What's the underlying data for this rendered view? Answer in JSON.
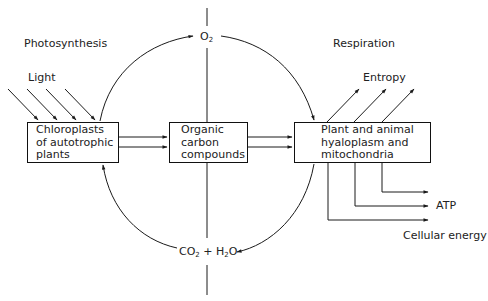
{
  "labels": {
    "photosynthesis": "Photosynthesis",
    "respiration": "Respiration",
    "light": "Light",
    "entropy": "Entropy",
    "atp": "ATP",
    "cellular_energy": "Cellular energy",
    "o2": {
      "base": "O",
      "sub": "2"
    },
    "co2_h2o": {
      "co": "CO",
      "co_sub": "2",
      "plus": " + ",
      "h": "H",
      "h_sub": "2",
      "o": "O"
    }
  },
  "boxes": {
    "chloroplasts": {
      "line1": "Chloroplasts",
      "line2": "of autotrophic",
      "line3": "plants"
    },
    "organic": {
      "line1": "Organic",
      "line2": "carbon",
      "line3": "compounds"
    },
    "respiration_box": {
      "line1": "Plant and animal",
      "line2": "hyaloplasm and",
      "line3": "mitochondria"
    }
  },
  "colors": {
    "line": "#1a1a1a",
    "background": "#ffffff"
  }
}
